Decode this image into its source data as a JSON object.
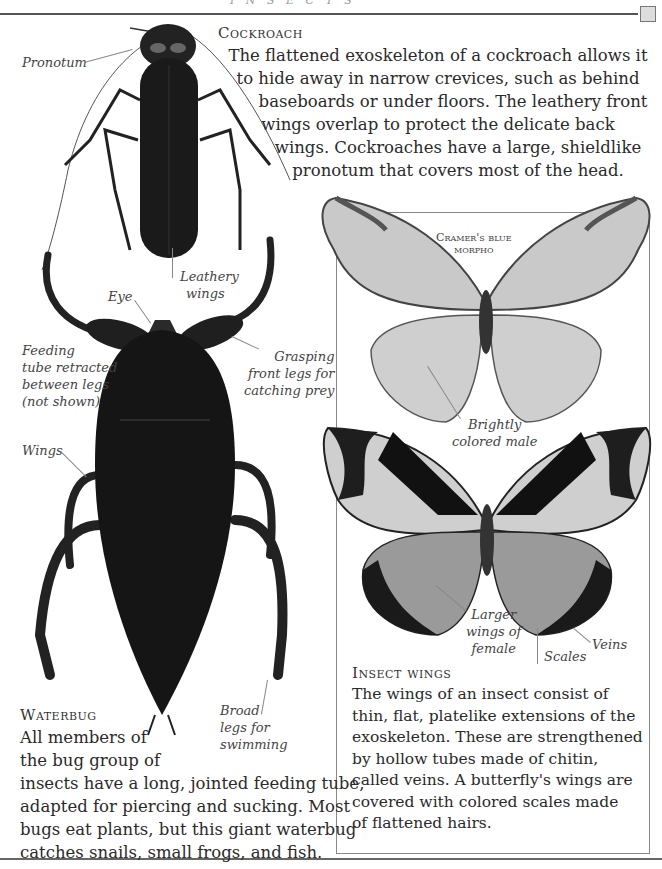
{
  "page": {
    "running_head": "I N S E C T S"
  },
  "cockroach": {
    "heading": "Cockroach",
    "body_lines": [
      "The flattened exoskeleton of a cockroach allows it",
      "to hide away in narrow crevices, such as behind",
      "baseboards or under floors. The leathery front",
      "wings overlap to protect the delicate back",
      "wings. Cockroaches have a large, shieldlike",
      "pronotum that covers most of the head."
    ],
    "labels": {
      "pronotum": "Pronotum",
      "leathery_wings": [
        "Leathery",
        "wings"
      ]
    }
  },
  "waterbug": {
    "heading": "Waterbug",
    "body_lines": [
      "All members of",
      "the bug group of",
      "insects have a long, jointed feeding tube,",
      "adapted for piercing and sucking. Most",
      "bugs eat plants, but this giant waterbug",
      "catches snails, small frogs, and fish."
    ],
    "labels": {
      "eye": "Eye",
      "feeding_tube": [
        "Feeding",
        "tube retracted",
        "between legs",
        "(not shown)"
      ],
      "grasping_legs": [
        "Grasping",
        "front legs for",
        "catching prey"
      ],
      "wings": "Wings",
      "broad_legs": [
        "Broad",
        "legs for",
        "swimming"
      ]
    }
  },
  "butterflies": {
    "species_label": [
      "Cramer's blue",
      "morpho"
    ],
    "labels": {
      "male": [
        "Brightly",
        "colored male"
      ],
      "female": [
        "Larger",
        "wings of",
        "female"
      ],
      "scales": "Scales",
      "veins": "Veins"
    }
  },
  "insect_wings": {
    "heading": "Insect wings",
    "body_lines": [
      "The wings of an insect consist of",
      "thin, flat, platelike extensions of the",
      "exoskeleton. These are strengthened",
      "by hollow tubes made of chitin,",
      "called veins. A butterfly's wings are",
      "covered with colored scales made",
      "of flattened hairs."
    ]
  }
}
